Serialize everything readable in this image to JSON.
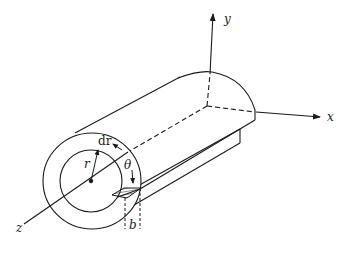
{
  "figure": {
    "type": "isometric diagram",
    "colors": {
      "stroke": "#1a1a1a",
      "background": "#ffffff"
    }
  },
  "labels": {
    "x_axis": "x",
    "y_axis": "y",
    "z_axis": "z",
    "radius": "r",
    "dr": "dr",
    "theta": "θ",
    "width": "b"
  }
}
